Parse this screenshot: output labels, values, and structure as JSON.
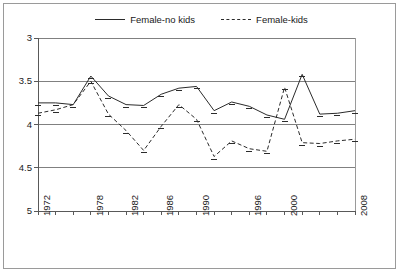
{
  "legend": {
    "entries": [
      {
        "label": "Female-no kids",
        "style": "solid",
        "color": "#2b2b2b"
      },
      {
        "label": "Female-kids",
        "style": "dashed",
        "color": "#2b2b2b"
      }
    ]
  },
  "axis": {
    "y_ticks": [
      "5",
      "4.5",
      "4",
      "3.5",
      "3"
    ],
    "x_tick_labels": [
      "1972",
      "1978",
      "1982",
      "1986",
      "1990",
      "1996",
      "2000",
      "2008"
    ]
  },
  "chart_data": {
    "type": "line",
    "title": "",
    "subtitle": "",
    "xlabel": "",
    "ylabel": "",
    "ylim": [
      3,
      5
    ],
    "ytick_values": [
      3,
      3.5,
      4,
      4.5,
      5
    ],
    "grid": true,
    "legend_position": "top-center",
    "x": [
      1972,
      1974,
      1976,
      1978,
      1980,
      1982,
      1984,
      1986,
      1988,
      1990,
      1992,
      1994,
      1996,
      1998,
      2000,
      2002,
      2004,
      2006,
      2008
    ],
    "xtick_labels_shown": [
      "1972",
      "1978",
      "1982",
      "1986",
      "1990",
      "1996",
      "2000",
      "2008"
    ],
    "series": [
      {
        "name": "Female-no kids",
        "style": "solid",
        "color": "#2b2b2b",
        "values": [
          4.25,
          4.25,
          4.23,
          4.56,
          4.33,
          4.23,
          4.22,
          4.35,
          4.42,
          4.44,
          4.16,
          4.26,
          4.21,
          4.11,
          4.06,
          4.58,
          4.12,
          4.13,
          4.16
        ]
      },
      {
        "name": "Female-kids",
        "style": "dashed",
        "color": "#2b2b2b",
        "values": [
          4.13,
          4.17,
          4.23,
          4.5,
          4.12,
          3.93,
          3.7,
          3.98,
          4.23,
          4.06,
          3.63,
          3.81,
          3.72,
          3.69,
          4.43,
          3.79,
          3.78,
          3.81,
          3.83
        ]
      }
    ]
  },
  "plot_geometry": {
    "left": 38,
    "right": 355,
    "top": 38,
    "bottom": 211
  }
}
